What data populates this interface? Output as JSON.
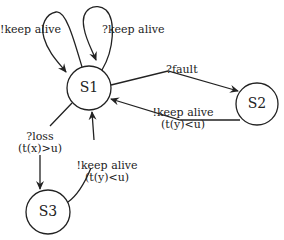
{
  "diagram": {
    "type": "state-machine",
    "nodes": [
      {
        "id": "S1",
        "label": "S1"
      },
      {
        "id": "S2",
        "label": "S2"
      },
      {
        "id": "S3",
        "label": "S3"
      }
    ],
    "edges": [
      {
        "from": "S1",
        "to": "S1",
        "label": "!keep alive",
        "guard": ""
      },
      {
        "from": "S1",
        "to": "S1",
        "label": "?keep alive",
        "guard": ""
      },
      {
        "from": "S1",
        "to": "S2",
        "label": "?fault",
        "guard": ""
      },
      {
        "from": "S2",
        "to": "S1",
        "label": "!keep alive",
        "guard": "(t(y)<u)"
      },
      {
        "from": "S1",
        "to": "S3",
        "label": "?loss",
        "guard": "(t(x)>u)"
      },
      {
        "from": "S3",
        "to": "S1",
        "label": "!keep alive",
        "guard": "(t(y)<u)"
      }
    ],
    "colors": {
      "stroke": "#222222",
      "background": "#ffffff"
    }
  }
}
